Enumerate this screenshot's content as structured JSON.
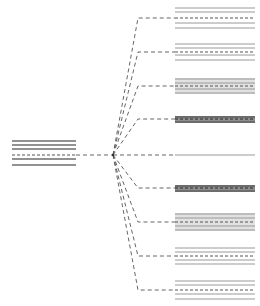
{
  "diagram": {
    "type": "fan-out tree",
    "canvas": {
      "width": 260,
      "height": 306,
      "background": "#ffffff"
    },
    "colors": {
      "line": "#6e6e6e",
      "dash": "#555555",
      "block_light": "#9a9a9a",
      "block_dark": "#4a4a4a",
      "shaded_fill": "#a8a8a8"
    },
    "hub": {
      "x": 113,
      "y": 155
    },
    "source": {
      "x1": 12,
      "x2": 76,
      "rows": [
        {
          "y": 141,
          "style": "solid"
        },
        {
          "y": 145,
          "style": "solid"
        },
        {
          "y": 149,
          "style": "solid"
        },
        {
          "y": 155,
          "style": "dashed"
        },
        {
          "y": 159,
          "style": "solid"
        },
        {
          "y": 165,
          "style": "solid"
        }
      ]
    },
    "elbow_x": 138,
    "targets": [
      {
        "id": "t1",
        "anchor_y": 18,
        "x1": 175,
        "x2": 255,
        "shaded": false,
        "rows": [
          {
            "y": 8
          },
          {
            "y": 12
          },
          {
            "y": 18,
            "style": "dashed"
          },
          {
            "y": 23
          },
          {
            "y": 28
          }
        ]
      },
      {
        "id": "t2",
        "anchor_y": 52,
        "x1": 175,
        "x2": 255,
        "shaded": false,
        "rows": [
          {
            "y": 44
          },
          {
            "y": 48
          },
          {
            "y": 52,
            "style": "dashed"
          },
          {
            "y": 55
          },
          {
            "y": 60
          }
        ]
      },
      {
        "id": "t3",
        "anchor_y": 86,
        "x1": 175,
        "x2": 255,
        "shaded": true,
        "rows": [
          {
            "y": 79
          },
          {
            "y": 83
          },
          {
            "y": 86,
            "style": "dashed"
          },
          {
            "y": 89
          },
          {
            "y": 93
          }
        ]
      },
      {
        "id": "t4",
        "anchor_y": 119,
        "x1": 175,
        "x2": 255,
        "shaded": true,
        "dark": true,
        "rows": [
          {
            "y": 117
          },
          {
            "y": 119,
            "style": "dashed"
          },
          {
            "y": 122
          }
        ]
      },
      {
        "id": "t5-center",
        "anchor_y": 155,
        "x1": 175,
        "x2": 255,
        "shaded": false,
        "straight": true,
        "rows": [
          {
            "y": 155
          }
        ]
      },
      {
        "id": "t6",
        "anchor_y": 188,
        "x1": 175,
        "x2": 255,
        "shaded": true,
        "dark": true,
        "rows": [
          {
            "y": 186
          },
          {
            "y": 188,
            "style": "dashed"
          },
          {
            "y": 191
          }
        ]
      },
      {
        "id": "t7",
        "anchor_y": 222,
        "x1": 175,
        "x2": 255,
        "shaded": true,
        "rows": [
          {
            "y": 214
          },
          {
            "y": 218
          },
          {
            "y": 222,
            "style": "dashed"
          },
          {
            "y": 226
          },
          {
            "y": 230
          }
        ]
      },
      {
        "id": "t8",
        "anchor_y": 256,
        "x1": 175,
        "x2": 255,
        "shaded": false,
        "rows": [
          {
            "y": 248
          },
          {
            "y": 252
          },
          {
            "y": 256,
            "style": "dashed"
          },
          {
            "y": 260
          },
          {
            "y": 264
          }
        ]
      },
      {
        "id": "t9",
        "anchor_y": 290,
        "x1": 175,
        "x2": 255,
        "shaded": false,
        "rows": [
          {
            "y": 281
          },
          {
            "y": 285
          },
          {
            "y": 290,
            "style": "dashed"
          },
          {
            "y": 294
          },
          {
            "y": 299
          }
        ]
      }
    ]
  }
}
